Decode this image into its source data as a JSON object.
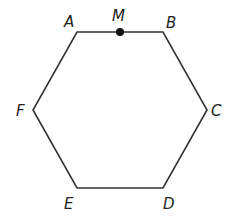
{
  "diagram": {
    "type": "regular-hexagon",
    "stroke_color": "#333333",
    "point_color": "#111111",
    "vertices": [
      {
        "label": "A",
        "x": 77,
        "y": 32,
        "lx": 64,
        "ly": 27
      },
      {
        "label": "B",
        "x": 163,
        "y": 32,
        "lx": 166,
        "ly": 28
      },
      {
        "label": "C",
        "x": 207,
        "y": 110,
        "lx": 211,
        "ly": 116
      },
      {
        "label": "D",
        "x": 163,
        "y": 188,
        "lx": 163,
        "ly": 209
      },
      {
        "label": "E",
        "x": 77,
        "y": 188,
        "lx": 64,
        "ly": 209
      },
      {
        "label": "F",
        "x": 33,
        "y": 110,
        "lx": 16,
        "ly": 116
      }
    ],
    "points": [
      {
        "label": "M",
        "x": 120,
        "y": 32,
        "lx": 112,
        "ly": 21
      }
    ]
  }
}
